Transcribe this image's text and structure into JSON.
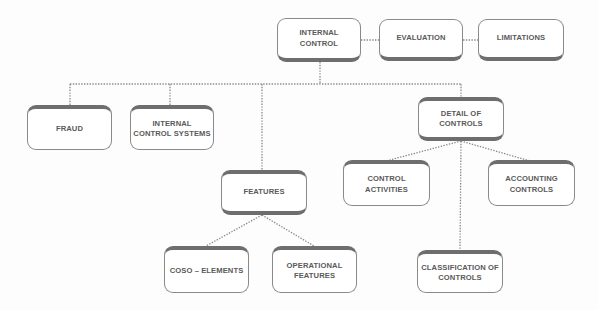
{
  "diagram": {
    "type": "concept-map",
    "nodes": {
      "internal_control": "INTERNAL\nCONTROL",
      "evaluation": "EVALUATION",
      "limitations": "LIMITATIONS",
      "fraud": "FRAUD",
      "internal_control_systems": "INTERNAL\nCONTROL SYSTEMS",
      "detail_of_controls": "DETAIL OF\nCONTROLS",
      "features": "FEATURES",
      "control_activities": "CONTROL\nACTIVITIES",
      "accounting_controls": "ACCOUNTING\nCONTROLS",
      "coso_elements": "COSO – ELEMENTS",
      "operational_features": "OPERATIONAL\nFEATURES",
      "classification_of_controls": "CLASSIFICATION OF\nCONTROLS"
    },
    "edges": [
      [
        "internal_control",
        "evaluation"
      ],
      [
        "evaluation",
        "limitations"
      ],
      [
        "internal_control",
        "fraud"
      ],
      [
        "internal_control",
        "internal_control_systems"
      ],
      [
        "internal_control",
        "features"
      ],
      [
        "internal_control",
        "detail_of_controls"
      ],
      [
        "detail_of_controls",
        "control_activities"
      ],
      [
        "detail_of_controls",
        "accounting_controls"
      ],
      [
        "detail_of_controls",
        "classification_of_controls"
      ],
      [
        "features",
        "coso_elements"
      ],
      [
        "features",
        "operational_features"
      ]
    ],
    "colors": {
      "border": "#8a8a8a",
      "shadow": "#6e6e6e",
      "text": "#5a5a5a",
      "connector": "#8a8a8a"
    }
  }
}
